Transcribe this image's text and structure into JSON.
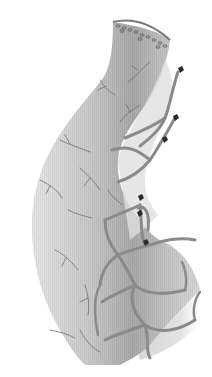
{
  "figure": {
    "alt": "Illustration of a curved intestinal segment with a sutured top edge, branching mesenteric blood vessels forming arcades, and ligature clips along the mesenteric border"
  },
  "colors": {
    "background": "#ffffff",
    "bowel_light": "#d9d9d9",
    "bowel_mid": "#bdbdbd",
    "bowel_dark": "#9a9a9a",
    "mesentery": "#e4e4e4",
    "vessel": "#8a8a8a",
    "vessel_fine": "#6e6e6e",
    "clip": "#2a2a2a",
    "suture": "#555555"
  },
  "elements": {
    "sutures": {
      "count": 12
    },
    "clips": {
      "count": 6
    }
  }
}
